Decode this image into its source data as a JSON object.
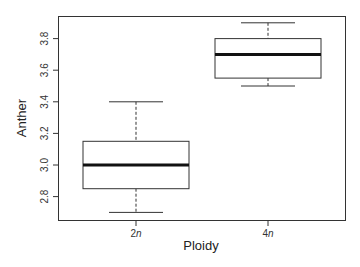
{
  "chart_data": {
    "type": "boxplot",
    "title": "",
    "xlabel": "Ploidy",
    "ylabel": "Anther",
    "categories": [
      "2n",
      "4n"
    ],
    "category_display": [
      {
        "num": "2",
        "italic": "n"
      },
      {
        "num": "4",
        "italic": "n"
      }
    ],
    "boxes": [
      {
        "name": "2n",
        "whisker_low": 2.7,
        "q1": 2.85,
        "median": 3.0,
        "q3": 3.15,
        "whisker_high": 3.4
      },
      {
        "name": "4n",
        "whisker_low": 3.5,
        "q1": 3.55,
        "median": 3.7,
        "q3": 3.8,
        "whisker_high": 3.9
      }
    ],
    "yticks": [
      2.8,
      3.0,
      3.2,
      3.4,
      3.6,
      3.8
    ],
    "ytick_labels": [
      "2.8",
      "3.0",
      "3.2",
      "3.4",
      "3.6",
      "3.8"
    ],
    "ylim": [
      2.66,
      3.95
    ],
    "grid": false,
    "legend": null
  }
}
